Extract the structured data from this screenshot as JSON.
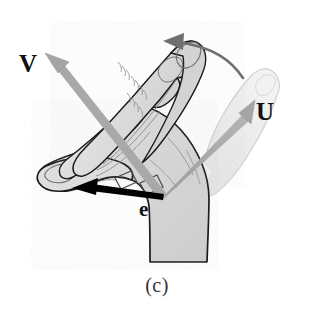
{
  "figure": {
    "caption": "(c)",
    "background_color": "#ffffff",
    "width": 314,
    "height": 324
  },
  "labels": {
    "v_vector": "V",
    "u_vector": "U",
    "e_vector": "e"
  },
  "colors": {
    "hand_fill": "#d7d7d7",
    "hand_fill_light": "#e2e2e2",
    "hand_outline": "#1a1a1a",
    "ghost_fill": "#ededed",
    "ghost_outline": "#c9c9c9",
    "crease_line": "#8d8d8d",
    "gray_arrow": "#a8a8a8",
    "gray_arrow_dark": "#8f8f8f",
    "rotation_arrow": "#6f6f6f",
    "black_arrow": "#000000",
    "label_text": "#111111",
    "caption_text": "#333333"
  },
  "vectors": [
    {
      "name": "V",
      "style": "gray-thick-arrow",
      "color": "#a8a8a8",
      "from": [
        163,
        197
      ],
      "to": [
        50,
        58
      ],
      "description": "points up-left along the extended fingers"
    },
    {
      "name": "U",
      "style": "gray-thick-arrow",
      "color": "#a8a8a8",
      "from": [
        163,
        197
      ],
      "to": [
        247,
        105
      ],
      "description": "points up-right along the ghosted finger"
    },
    {
      "name": "e",
      "style": "black-solid-arrow",
      "color": "#000000",
      "from": [
        162,
        198
      ],
      "to": [
        74,
        190
      ],
      "description": "points left along the thumb"
    }
  ],
  "rotation_arrow": {
    "name": "rotation-arrow",
    "color": "#6f6f6f",
    "direction": "counter-clockwise-to-left",
    "from": [
      243,
      76
    ],
    "to": [
      166,
      42
    ]
  },
  "annotations": {
    "right_angle_markers": 2,
    "right_angle_marker_color": "#555555"
  }
}
